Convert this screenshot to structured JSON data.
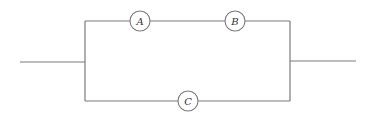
{
  "diagram": {
    "type": "circuit",
    "components": [
      {
        "id": "A",
        "label": "A",
        "cx": 140,
        "cy": 21,
        "r": 10
      },
      {
        "id": "B",
        "label": "B",
        "cx": 235,
        "cy": 21,
        "r": 10
      },
      {
        "id": "C",
        "label": "C",
        "cx": 188,
        "cy": 101,
        "r": 10
      }
    ],
    "colors": {
      "wire": "#7a7a7a",
      "label": "#333333"
    }
  }
}
